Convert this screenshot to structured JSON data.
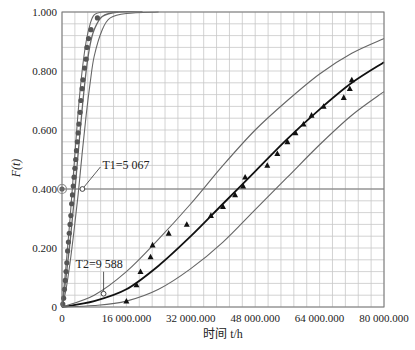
{
  "chart_data": {
    "type": "line",
    "title": "",
    "xlabel": "时间 t/h",
    "ylabel": "F(t)",
    "xlim": [
      0,
      80000
    ],
    "ylim": [
      0,
      1.0
    ],
    "grid": true,
    "x_ticks": [
      "0",
      "16 000.000",
      "32 000.000",
      "48 000.000",
      "64 000.000",
      "80 000.000"
    ],
    "y_ticks": [
      "0",
      "0.200",
      "0.400",
      "0.600",
      "0.800",
      "1.000"
    ],
    "annotations": [
      {
        "text": "T1=5 067",
        "x": 5067,
        "y": 0.4
      },
      {
        "text": "T2=9 588",
        "x": 9588,
        "y": 0.045
      }
    ],
    "reference_line": {
      "y": 0.4
    },
    "series": [
      {
        "name": "Group 1 data",
        "marker": "circle",
        "points": [
          [
            200,
            0.01
          ],
          [
            400,
            0.03
          ],
          [
            600,
            0.06
          ],
          [
            800,
            0.09
          ],
          [
            1000,
            0.12
          ],
          [
            1200,
            0.15
          ],
          [
            1400,
            0.19
          ],
          [
            1600,
            0.22
          ],
          [
            1800,
            0.25
          ],
          [
            2000,
            0.28
          ],
          [
            2200,
            0.31
          ],
          [
            2400,
            0.35
          ],
          [
            2600,
            0.38
          ],
          [
            2800,
            0.41
          ],
          [
            3000,
            0.44
          ],
          [
            3200,
            0.47
          ],
          [
            3400,
            0.5
          ],
          [
            3600,
            0.53
          ],
          [
            3800,
            0.56
          ],
          [
            4000,
            0.59
          ],
          [
            4200,
            0.62
          ],
          [
            4500,
            0.66
          ],
          [
            4700,
            0.7
          ],
          [
            5000,
            0.74
          ],
          [
            5200,
            0.77
          ],
          [
            5600,
            0.81
          ],
          [
            6000,
            0.84
          ],
          [
            6200,
            0.88
          ],
          [
            6600,
            0.91
          ],
          [
            7200,
            0.94
          ],
          [
            8800,
            0.98
          ]
        ]
      },
      {
        "name": "Group 1 fit",
        "style": "solid",
        "points": [
          [
            0,
            0
          ],
          [
            1000,
            0.1
          ],
          [
            2000,
            0.22
          ],
          [
            3000,
            0.36
          ],
          [
            4000,
            0.52
          ],
          [
            5000,
            0.67
          ],
          [
            6000,
            0.8
          ],
          [
            7000,
            0.89
          ],
          [
            8000,
            0.94
          ],
          [
            10000,
            0.985
          ],
          [
            14000,
            1.0
          ],
          [
            20000,
            1.0
          ]
        ]
      },
      {
        "name": "Group 1 upper bound",
        "style": "thin",
        "points": [
          [
            0,
            0
          ],
          [
            1000,
            0.14
          ],
          [
            2000,
            0.3
          ],
          [
            3000,
            0.48
          ],
          [
            4000,
            0.66
          ],
          [
            5000,
            0.8
          ],
          [
            6000,
            0.9
          ],
          [
            7000,
            0.96
          ],
          [
            8000,
            0.99
          ],
          [
            10000,
            1.0
          ],
          [
            14000,
            1.0
          ]
        ]
      },
      {
        "name": "Group 1 lower bound",
        "style": "thin",
        "points": [
          [
            0,
            0
          ],
          [
            1000,
            0.06
          ],
          [
            2000,
            0.15
          ],
          [
            3000,
            0.26
          ],
          [
            4000,
            0.38
          ],
          [
            5000,
            0.52
          ],
          [
            6000,
            0.65
          ],
          [
            7000,
            0.76
          ],
          [
            8000,
            0.85
          ],
          [
            10000,
            0.94
          ],
          [
            12000,
            0.98
          ],
          [
            16000,
            0.995
          ],
          [
            24000,
            1.0
          ]
        ]
      },
      {
        "name": "Group 2 data",
        "marker": "triangle",
        "points": [
          [
            16000,
            0.02
          ],
          [
            18500,
            0.075
          ],
          [
            19500,
            0.12
          ],
          [
            22000,
            0.17
          ],
          [
            22500,
            0.21
          ],
          [
            26500,
            0.25
          ],
          [
            31000,
            0.28
          ],
          [
            37000,
            0.31
          ],
          [
            40000,
            0.34
          ],
          [
            43000,
            0.38
          ],
          [
            45000,
            0.41
          ],
          [
            45500,
            0.44
          ],
          [
            51000,
            0.48
          ],
          [
            53500,
            0.52
          ],
          [
            56000,
            0.56
          ],
          [
            58000,
            0.59
          ],
          [
            60000,
            0.62
          ],
          [
            62000,
            0.65
          ],
          [
            65000,
            0.68
          ],
          [
            70000,
            0.71
          ],
          [
            71500,
            0.74
          ],
          [
            72000,
            0.77
          ]
        ]
      },
      {
        "name": "Group 2 fit",
        "style": "thick",
        "points": [
          [
            0,
            0
          ],
          [
            8000,
            0.02
          ],
          [
            16000,
            0.06
          ],
          [
            24000,
            0.14
          ],
          [
            32000,
            0.24
          ],
          [
            40000,
            0.35
          ],
          [
            48000,
            0.46
          ],
          [
            56000,
            0.57
          ],
          [
            64000,
            0.67
          ],
          [
            72000,
            0.76
          ],
          [
            80000,
            0.83
          ]
        ]
      },
      {
        "name": "Group 2 upper bound",
        "style": "thin",
        "points": [
          [
            0,
            0
          ],
          [
            8000,
            0.04
          ],
          [
            16000,
            0.12
          ],
          [
            24000,
            0.23
          ],
          [
            32000,
            0.35
          ],
          [
            40000,
            0.48
          ],
          [
            48000,
            0.6
          ],
          [
            56000,
            0.7
          ],
          [
            64000,
            0.79
          ],
          [
            72000,
            0.86
          ],
          [
            80000,
            0.91
          ]
        ]
      },
      {
        "name": "Group 2 lower bound",
        "style": "thin",
        "points": [
          [
            0,
            0
          ],
          [
            8000,
            0.005
          ],
          [
            16000,
            0.02
          ],
          [
            24000,
            0.06
          ],
          [
            32000,
            0.13
          ],
          [
            40000,
            0.22
          ],
          [
            48000,
            0.33
          ],
          [
            56000,
            0.44
          ],
          [
            64000,
            0.55
          ],
          [
            72000,
            0.65
          ],
          [
            80000,
            0.73
          ]
        ]
      }
    ]
  }
}
